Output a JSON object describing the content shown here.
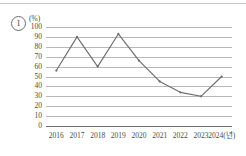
{
  "figure": {
    "item_marker": "1",
    "unit_label": "(%)"
  },
  "chart_data": {
    "type": "line",
    "title": "",
    "xlabel": "",
    "ylabel": "(%)",
    "categories": [
      "2016",
      "2017",
      "2018",
      "2019",
      "2020",
      "2021",
      "2022",
      "2023",
      "2024"
    ],
    "x_tick_labels": [
      "2016",
      "2017",
      "2018",
      "2019",
      "2020",
      "2021",
      "2022",
      "2023",
      "2024(년)"
    ],
    "values": [
      56,
      90,
      60,
      93,
      66,
      45,
      34,
      30,
      50
    ],
    "ylim": [
      0,
      100
    ],
    "y_ticks": [
      100,
      90,
      80,
      70,
      60,
      50,
      40,
      30,
      20,
      10,
      0
    ],
    "y_tick_labels": [
      "100",
      "90",
      "80",
      "70",
      "60",
      "50",
      "40",
      "30",
      "20",
      "10",
      "0"
    ],
    "grid": "horizontal",
    "legend": "none",
    "line_color": "#6b6b6b",
    "marker": "dot"
  }
}
